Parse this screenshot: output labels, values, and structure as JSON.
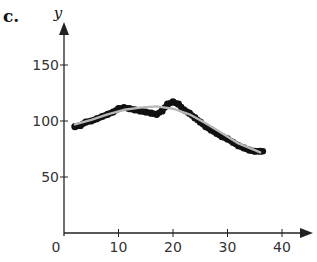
{
  "panel_label": "c.",
  "chart_data": {
    "type": "scatter",
    "title": "",
    "xlabel": "",
    "ylabel": "y",
    "xlim": [
      0,
      42
    ],
    "ylim": [
      0,
      165
    ],
    "x_ticks": [
      0,
      10,
      20,
      30,
      40
    ],
    "y_ticks": [
      50,
      100,
      150
    ],
    "grid": false,
    "legend": null,
    "series": [
      {
        "name": "data",
        "kind": "scatter",
        "x": [
          2,
          3,
          4,
          5,
          6,
          7,
          8,
          9,
          10,
          11,
          12,
          13,
          14,
          15,
          16,
          17,
          18,
          19,
          20,
          21,
          22,
          23,
          24,
          25,
          26,
          27,
          28,
          29,
          30,
          31,
          32,
          33,
          34,
          35,
          36
        ],
        "y": [
          95,
          96,
          99,
          100,
          102,
          104,
          106,
          108,
          111,
          112,
          111,
          110,
          109,
          108,
          107,
          106,
          109,
          115,
          117,
          115,
          110,
          107,
          103,
          99,
          95,
          92,
          89,
          86,
          84,
          81,
          78,
          76,
          74,
          73,
          73
        ]
      },
      {
        "name": "fitted curve",
        "kind": "line",
        "x": [
          2,
          5,
          8,
          11,
          14,
          17,
          20,
          23,
          26,
          29,
          32,
          35,
          36
        ],
        "y": [
          97,
          101,
          106,
          110,
          112,
          113,
          111,
          106,
          98,
          89,
          80,
          74,
          72
        ]
      }
    ]
  },
  "colors": {
    "points": "#111111",
    "curve": "#b8b8b8",
    "axis": "#222222"
  }
}
